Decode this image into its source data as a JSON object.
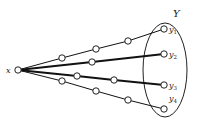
{
  "diagram": {
    "source": {
      "label": "x",
      "cx": 18,
      "cy": 70
    },
    "set": {
      "label": "Y",
      "cx": 165,
      "cy": 70,
      "rx": 22,
      "ry": 47,
      "label_x": 173,
      "label_y": 17
    },
    "targets": [
      {
        "label": "y1",
        "sub": "1",
        "cx": 164,
        "cy": 29
      },
      {
        "label": "y2",
        "sub": "2",
        "cx": 164,
        "cy": 54
      },
      {
        "label": "y3",
        "sub": "3",
        "cx": 164,
        "cy": 85
      },
      {
        "label": "y4",
        "sub": "4",
        "cx": 164,
        "cy": 109
      }
    ],
    "paths": [
      {
        "to": "y1",
        "thick": false,
        "nodes": [
          [
            62,
            58
          ],
          [
            96,
            49
          ],
          [
            128,
            41
          ]
        ]
      },
      {
        "to": "y2",
        "thick": true,
        "nodes": [
          [
            92,
            62
          ]
        ]
      },
      {
        "to": "y3",
        "thick": true,
        "nodes": [
          [
            77,
            76
          ],
          [
            114,
            80
          ]
        ]
      },
      {
        "to": "y4",
        "thick": false,
        "nodes": [
          [
            62,
            81
          ],
          [
            96,
            91
          ],
          [
            128,
            100
          ]
        ]
      }
    ]
  }
}
